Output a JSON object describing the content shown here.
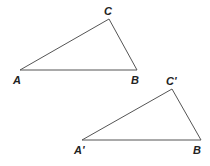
{
  "diagram": {
    "triangles": [
      {
        "name": "ABC",
        "points": {
          "A": [
            20,
            70
          ],
          "B": [
            137,
            70
          ],
          "C": [
            109,
            19
          ]
        },
        "labels": {
          "A": "A",
          "B": "B",
          "C": "C"
        }
      },
      {
        "name": "A'BC'",
        "points": {
          "A": [
            82,
            140
          ],
          "B": [
            201,
            140
          ],
          "C": [
            172,
            89
          ]
        },
        "labels": {
          "A": "A'",
          "B": "B",
          "C": "C'"
        }
      }
    ],
    "stroke_color": "#555555"
  }
}
